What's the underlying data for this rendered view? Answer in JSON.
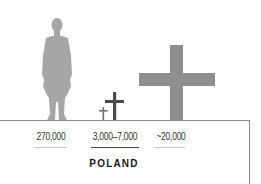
{
  "figures": [
    {
      "name": "human-silhouette",
      "color": "#a6a6a6"
    },
    {
      "name": "small-cross",
      "color": "#707070"
    },
    {
      "name": "medium-cross",
      "color": "#4a4a4a"
    },
    {
      "name": "large-cross",
      "color": "#8f8f8f"
    }
  ],
  "labels": [
    {
      "text": "270,000",
      "underline_color": "#c8c8c8"
    },
    {
      "text": "3,000–7,000",
      "underline_color": "#4a4a4a"
    },
    {
      "text": "~20,000",
      "underline_color": "#c8c8c8"
    }
  ],
  "country": "POLAND"
}
